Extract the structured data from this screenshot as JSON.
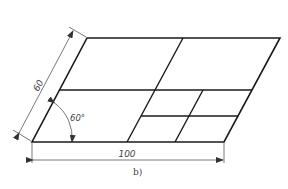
{
  "figure": {
    "caption": "b)",
    "colors": {
      "outline": "#1a1a1a",
      "dimension": "#555555",
      "background": "#ffffff"
    }
  },
  "dimensions": {
    "slant_length": "60",
    "base_length": "100",
    "angle": "60°"
  },
  "geometry": {
    "parallelogram": {
      "top_left": [
        87,
        38
      ],
      "top_right": [
        280,
        38
      ],
      "bottom_right": [
        224,
        142
      ],
      "bottom_left": [
        32,
        142
      ]
    },
    "inner_lines": [
      {
        "name": "main-slant-divider",
        "x1": 183,
        "y1": 38,
        "x2": 127,
        "y2": 142
      },
      {
        "name": "middle-horizontal",
        "x1": 59,
        "y1": 90,
        "x2": 252,
        "y2": 90
      },
      {
        "name": "lower-horizontal",
        "x1": 141,
        "y1": 116,
        "x2": 238,
        "y2": 116
      },
      {
        "name": "second-slant-divider",
        "x1": 203,
        "y1": 90,
        "x2": 175,
        "y2": 142
      }
    ]
  }
}
